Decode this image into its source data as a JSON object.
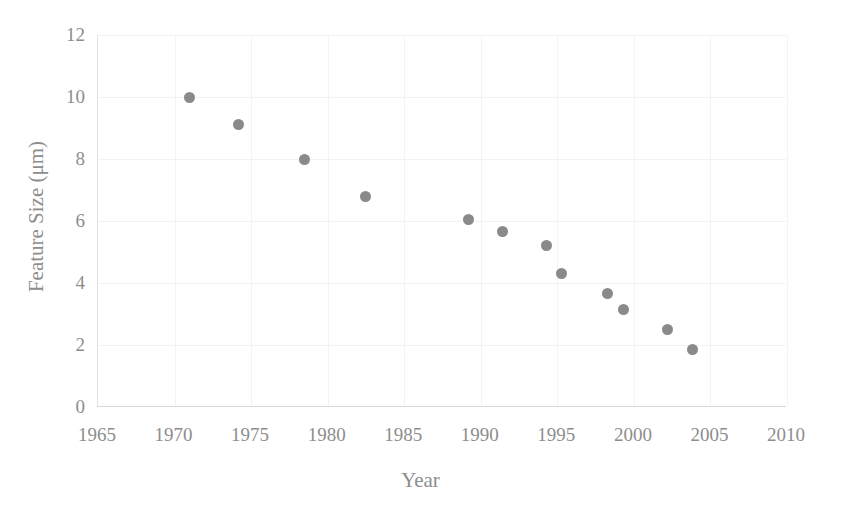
{
  "chart_data": {
    "type": "scatter",
    "title": "",
    "xlabel": "Year",
    "ylabel": "Feature Size (μm)",
    "xlim": [
      1965,
      2010
    ],
    "ylim": [
      0,
      12
    ],
    "xticks": [
      1965,
      1970,
      1975,
      1980,
      1985,
      1990,
      1995,
      2000,
      2005,
      2010
    ],
    "yticks": [
      0,
      2,
      4,
      6,
      8,
      10,
      12
    ],
    "xtick_labels": [
      "1965",
      "1970",
      "1975",
      "1980",
      "1985",
      "1990",
      "1995",
      "2000",
      "2005",
      "2010"
    ],
    "ytick_labels": [
      "0",
      "2",
      "4",
      "6",
      "8",
      "10",
      "12"
    ],
    "grid": true,
    "grid_axis": "both",
    "legend": null,
    "marker": "circle",
    "marker_color": "#8a8a8a",
    "marker_size": 11,
    "series": [
      {
        "name": "Feature Size",
        "x": [
          1971.0,
          1974.2,
          1978.5,
          1982.5,
          1989.2,
          1991.4,
          1994.3,
          1995.3,
          1998.3,
          1999.3,
          2002.2,
          2003.8
        ],
        "y": [
          10.0,
          9.1,
          8.0,
          6.8,
          6.05,
          5.65,
          5.2,
          4.3,
          3.65,
          3.15,
          2.5,
          1.85
        ]
      }
    ],
    "points": [
      {
        "x": 1971.0,
        "y": 10.0
      },
      {
        "x": 1974.2,
        "y": 9.1
      },
      {
        "x": 1978.5,
        "y": 8.0
      },
      {
        "x": 1982.5,
        "y": 6.8
      },
      {
        "x": 1989.2,
        "y": 6.05
      },
      {
        "x": 1991.4,
        "y": 5.65
      },
      {
        "x": 1994.3,
        "y": 5.2
      },
      {
        "x": 1995.3,
        "y": 4.3
      },
      {
        "x": 1998.3,
        "y": 3.65
      },
      {
        "x": 1999.3,
        "y": 3.15
      },
      {
        "x": 2002.2,
        "y": 2.5
      },
      {
        "x": 2003.8,
        "y": 1.85
      }
    ]
  },
  "style": {
    "background": "#ffffff",
    "tick_color": "#8d8d8d",
    "axis_line_color": "#dddddd",
    "grid_color": "#f2f2f2"
  }
}
